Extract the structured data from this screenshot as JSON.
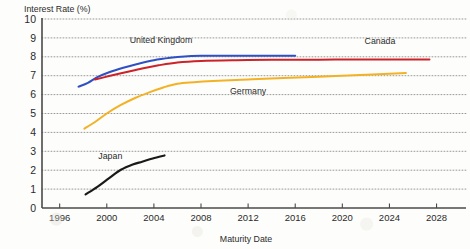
{
  "chart_data": {
    "type": "line",
    "title": "",
    "ylabel": "Interest Rate (%)",
    "xlabel": "Maturity Date",
    "xlim": [
      1994.5,
      2030.5
    ],
    "ylim": [
      0,
      10
    ],
    "grid": true,
    "grid_style": "dotted-horizontal",
    "legend": "inline-labels",
    "xticks": [
      "1996",
      "2000",
      "2004",
      "2008",
      "2012",
      "2016",
      "2020",
      "2024",
      "2028"
    ],
    "yticks": [
      "0",
      "1",
      "2",
      "3",
      "4",
      "5",
      "6",
      "7",
      "8",
      "9",
      "10"
    ],
    "series": [
      {
        "name": "United Kingdom",
        "color": "#2f4fc4",
        "label_x": 2004.6,
        "label_y": 8.72,
        "x": [
          1997.6,
          1998.4,
          1999.2,
          2000.2,
          2001.4,
          2002.6,
          2004.0,
          2005.4,
          2006.6,
          2008.0,
          2010.0,
          2012.0,
          2014.0,
          2016.0
        ],
        "y": [
          6.42,
          6.62,
          6.92,
          7.18,
          7.42,
          7.62,
          7.82,
          7.95,
          8.02,
          8.05,
          8.06,
          8.06,
          8.06,
          8.06
        ]
      },
      {
        "name": "Canada",
        "color": "#cc2229",
        "label_x": 2023.2,
        "label_y": 8.66,
        "x": [
          1999.0,
          2000.2,
          2001.6,
          2003.0,
          2004.4,
          2006.0,
          2008.0,
          2011.0,
          2014.0,
          2018.0,
          2022.0,
          2025.0,
          2027.4
        ],
        "y": [
          6.8,
          6.98,
          7.18,
          7.38,
          7.55,
          7.7,
          7.78,
          7.82,
          7.84,
          7.85,
          7.86,
          7.86,
          7.86
        ]
      },
      {
        "name": "Germany",
        "color": "#f3b225",
        "label_x": 2012.0,
        "label_y": 6.05,
        "x": [
          1998.1,
          1999.0,
          2000.0,
          2001.2,
          2002.4,
          2003.6,
          2004.8,
          2006.0,
          2007.4,
          2009.0,
          2012.0,
          2015.0,
          2018.0,
          2021.0,
          2024.0,
          2025.4
        ],
        "y": [
          4.2,
          4.55,
          5.0,
          5.45,
          5.82,
          6.12,
          6.38,
          6.58,
          6.66,
          6.72,
          6.8,
          6.88,
          6.95,
          7.02,
          7.1,
          7.14
        ]
      },
      {
        "name": "Japan",
        "color": "#1a1a1a",
        "label_x": 2000.3,
        "label_y": 2.58,
        "x": [
          1998.2,
          1999.2,
          2000.2,
          2001.2,
          2002.2,
          2003.0,
          2003.9,
          2004.9
        ],
        "y": [
          0.72,
          1.12,
          1.58,
          2.02,
          2.3,
          2.45,
          2.62,
          2.78
        ]
      }
    ]
  }
}
